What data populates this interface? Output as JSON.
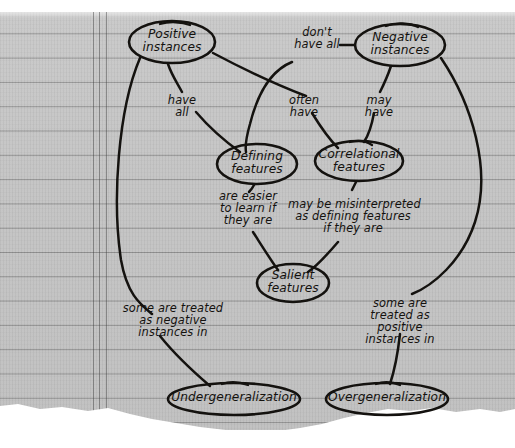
{
  "page": {
    "top_caption": "",
    "paper": {
      "sheet_color": "#c4c4c4",
      "rule_color": "#464646",
      "margin_line_color": "#3c3c3c",
      "ink_color": "#14120f"
    }
  },
  "diagram": {
    "nodes": [
      {
        "id": "positive-instances",
        "label": "Positive\ninstances",
        "cx": 172,
        "cy": 42,
        "rx": 43,
        "ry": 21
      },
      {
        "id": "negative-instances",
        "label": "Negative\ninstances",
        "cx": 400,
        "cy": 45,
        "rx": 45,
        "ry": 21
      },
      {
        "id": "defining-features",
        "label": "Defining\nfeatures",
        "cx": 257,
        "cy": 164,
        "rx": 40,
        "ry": 20
      },
      {
        "id": "correlational-features",
        "label": "Correlational\nfeatures",
        "cx": 359,
        "cy": 161,
        "rx": 44,
        "ry": 20
      },
      {
        "id": "salient-features",
        "label": "Salient\nfeatures",
        "cx": 293,
        "cy": 283,
        "rx": 36,
        "ry": 19
      },
      {
        "id": "undergeneralization",
        "label": "Undergeneralization",
        "cx": 234,
        "cy": 399,
        "rx": 66,
        "ry": 16
      },
      {
        "id": "overgeneralization",
        "label": "Overgeneralization",
        "cx": 387,
        "cy": 399,
        "rx": 61,
        "ry": 16
      }
    ],
    "edge_labels": [
      {
        "id": "have-all",
        "text": "have\nall",
        "x": 182,
        "y": 101
      },
      {
        "id": "dont-have-all",
        "text": "don't\nhave all",
        "x": 317,
        "y": 33
      },
      {
        "id": "often-have",
        "text": "often\nhave",
        "x": 303,
        "y": 101
      },
      {
        "id": "may-have",
        "text": "may\nhave",
        "x": 379,
        "y": 101
      },
      {
        "id": "are-easier-to-learn",
        "text": "are easier\nto learn if\nthey are",
        "x": 247,
        "y": 196
      },
      {
        "id": "may-be-misinterpreted",
        "text": "may be misinterpreted\nas defining features\nif they are",
        "x": 352,
        "y": 204
      },
      {
        "id": "treated-as-negative",
        "text": "some are treated\nas negative\ninstances in",
        "x": 172,
        "y": 308
      },
      {
        "id": "treated-as-positive",
        "text": "some are\ntreated as\npositive\ninstances in",
        "x": 400,
        "y": 303
      }
    ]
  }
}
